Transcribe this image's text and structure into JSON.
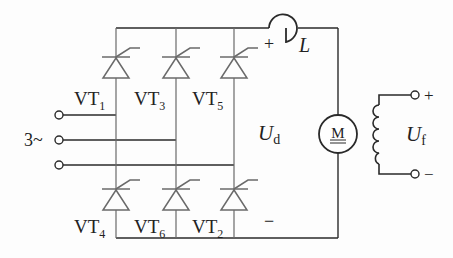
{
  "diagram": {
    "thyristors": [
      {
        "id": "VT1",
        "base": "VT",
        "sub": "1",
        "position": "upper-left"
      },
      {
        "id": "VT3",
        "base": "VT",
        "sub": "3",
        "position": "upper-middle"
      },
      {
        "id": "VT5",
        "base": "VT",
        "sub": "5",
        "position": "upper-right"
      },
      {
        "id": "VT4",
        "base": "VT",
        "sub": "4",
        "position": "lower-left"
      },
      {
        "id": "VT6",
        "base": "VT",
        "sub": "6",
        "position": "lower-middle"
      },
      {
        "id": "VT2",
        "base": "VT",
        "sub": "2",
        "position": "lower-right"
      }
    ],
    "ac_input_label": "3~",
    "inductor_label": "L",
    "dc_voltage": {
      "base": "U",
      "sub": "d",
      "plus": "+",
      "minus": "−"
    },
    "motor_label": "M",
    "field": {
      "base": "U",
      "sub": "f",
      "plus": "+",
      "minus": "−"
    },
    "colors": {
      "line": "#2a2a2a",
      "device": "#6a6a6a",
      "background": "#fdfdfd"
    }
  }
}
